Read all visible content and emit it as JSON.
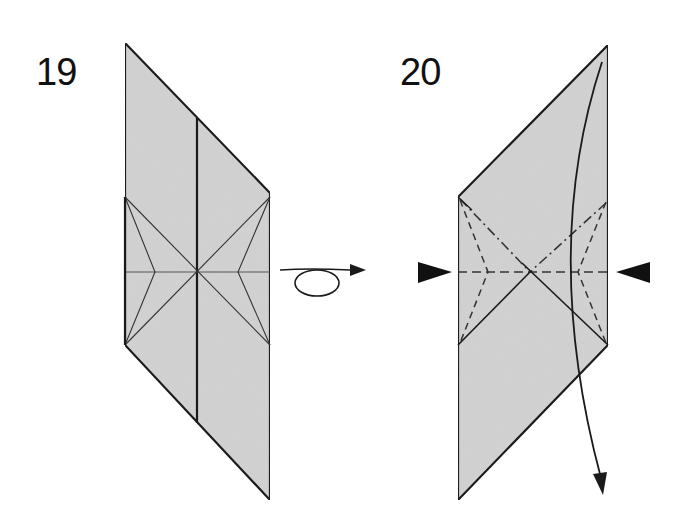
{
  "diagram": {
    "colors": {
      "paper": "#d3d3d3",
      "line": "#1a1a1a",
      "crease": "#333333",
      "background": "#ffffff"
    },
    "steps": [
      {
        "number": "19",
        "description": "Crease pattern with vertical center line, horizontal crease and X-shaped diagonals; turn model over",
        "symbols": [
          "turn-over-arrow"
        ]
      },
      {
        "number": "20",
        "description": "Mountain-fold (dash-dot) and valley-fold (dashed) lines with push-in arrows on both sides; curved arrow indicates folding the flap down",
        "symbols": [
          "push-arrow-left",
          "push-arrow-right",
          "fold-down-arrow"
        ]
      }
    ]
  }
}
